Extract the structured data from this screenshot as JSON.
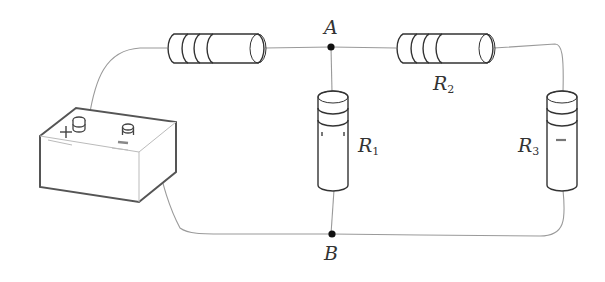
{
  "diagram": {
    "type": "circuit",
    "nodes": [
      {
        "id": "A",
        "label": "A"
      },
      {
        "id": "B",
        "label": "B"
      }
    ],
    "components": [
      {
        "id": "battery",
        "type": "battery",
        "terminals": [
          "+",
          "−"
        ]
      },
      {
        "id": "R_series",
        "type": "resistor",
        "label": ""
      },
      {
        "id": "R1",
        "type": "resistor",
        "label": "R",
        "subscript": "1"
      },
      {
        "id": "R2",
        "type": "resistor",
        "label": "R",
        "subscript": "2"
      },
      {
        "id": "R3",
        "type": "resistor",
        "label": "R",
        "subscript": "3"
      }
    ],
    "battery": {
      "plus_label": "+"
    },
    "labels": {
      "A": "A",
      "B": "B",
      "R1_main": "R",
      "R1_sub": "1",
      "R2_main": "R",
      "R2_sub": "2",
      "R3_main": "R",
      "R3_sub": "3"
    }
  }
}
